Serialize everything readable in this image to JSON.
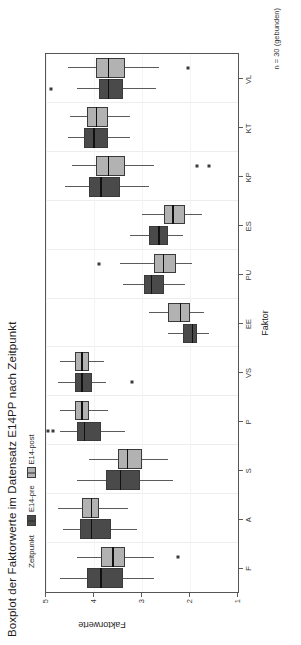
{
  "chart": {
    "title": "Boxplot der Faktorwerte im Datensatz E14PP nach Zeitpunkt",
    "caption": "n = 30 (gebunden)",
    "legend": {
      "title": "Zeitpunkt",
      "items": [
        {
          "label": "E14-pre",
          "color": "#4a4a4a",
          "key": "legend-key-pre"
        },
        {
          "label": "E14-post",
          "color": "#b2b2b2",
          "key": "legend-key-post"
        }
      ]
    },
    "x_axis": {
      "title": "Faktor"
    },
    "y_axis": {
      "title": "Faktorwerte",
      "ticks": [
        "5",
        "4",
        "3",
        "2",
        "1"
      ]
    }
  },
  "chart_data": {
    "type": "boxplot",
    "title": "Boxplot der Faktorwerte im Datensatz E14PP nach Zeitpunkt",
    "subtitle": "",
    "caption": "n = 30 (gebunden)",
    "xlabel": "Faktor",
    "ylabel": "Faktorwerte",
    "ylim": [
      1,
      5
    ],
    "yticks": [
      5,
      4,
      3,
      2,
      1
    ],
    "y_axis_inverted": true,
    "grid": true,
    "legend_position": "top",
    "legend_title": "Zeitpunkt",
    "orientation": "horizontal-boxes",
    "categories": [
      "F",
      "A",
      "S",
      "P",
      "VS",
      "EE",
      "PU",
      "ES",
      "KP",
      "KT",
      "VL"
    ],
    "series": [
      {
        "name": "E14-pre",
        "color": "#4a4a4a",
        "boxes": [
          {
            "category": "F",
            "min": 4.7,
            "q1": 4.15,
            "median": 3.85,
            "q3": 3.4,
            "max": 2.75,
            "outliers": []
          },
          {
            "category": "A",
            "min": 4.65,
            "q1": 4.3,
            "median": 4.05,
            "q3": 3.65,
            "max": 3.1,
            "outliers": []
          },
          {
            "category": "S",
            "min": 4.35,
            "q1": 3.75,
            "median": 3.45,
            "q3": 3.05,
            "max": 2.35,
            "outliers": []
          },
          {
            "category": "P",
            "min": 4.7,
            "q1": 4.35,
            "median": 4.2,
            "q3": 3.85,
            "max": 3.35,
            "outliers": [
              4.95,
              4.85
            ]
          },
          {
            "category": "VS",
            "min": 4.75,
            "q1": 4.4,
            "median": 4.25,
            "q3": 4.05,
            "max": 3.75,
            "outliers": [
              3.2
            ]
          },
          {
            "category": "EE",
            "min": 2.45,
            "q1": 2.15,
            "median": 1.95,
            "q3": 1.85,
            "max": 1.6,
            "outliers": []
          },
          {
            "category": "PU",
            "min": 3.4,
            "q1": 2.95,
            "median": 2.8,
            "q3": 2.55,
            "max": 2.1,
            "outliers": []
          },
          {
            "category": "ES",
            "min": 3.25,
            "q1": 2.85,
            "median": 2.65,
            "q3": 2.45,
            "max": 2.15,
            "outliers": []
          },
          {
            "category": "KP",
            "min": 4.6,
            "q1": 4.1,
            "median": 3.85,
            "q3": 3.45,
            "max": 2.85,
            "outliers": []
          },
          {
            "category": "KT",
            "min": 4.55,
            "q1": 4.2,
            "median": 4.0,
            "q3": 3.7,
            "max": 3.25,
            "outliers": []
          },
          {
            "category": "VL",
            "min": 4.35,
            "q1": 3.9,
            "median": 3.7,
            "q3": 3.4,
            "max": 2.7,
            "outliers": [
              4.9
            ]
          }
        ]
      },
      {
        "name": "E14-post",
        "color": "#b2b2b2",
        "boxes": [
          {
            "category": "F",
            "min": 4.35,
            "q1": 3.85,
            "median": 3.6,
            "q3": 3.35,
            "max": 2.75,
            "outliers": [
              2.25
            ]
          },
          {
            "category": "A",
            "min": 4.75,
            "q1": 4.25,
            "median": 4.05,
            "q3": 3.9,
            "max": 3.3,
            "outliers": []
          },
          {
            "category": "S",
            "min": 4.1,
            "q1": 3.5,
            "median": 3.3,
            "q3": 3.0,
            "max": 2.45,
            "outliers": []
          },
          {
            "category": "P",
            "min": 4.7,
            "q1": 4.4,
            "median": 4.25,
            "q3": 4.1,
            "max": 3.7,
            "outliers": []
          },
          {
            "category": "VS",
            "min": 4.7,
            "q1": 4.4,
            "median": 4.25,
            "q3": 4.1,
            "max": 3.8,
            "outliers": []
          },
          {
            "category": "EE",
            "min": 2.85,
            "q1": 2.45,
            "median": 2.2,
            "q3": 2.0,
            "max": 1.7,
            "outliers": []
          },
          {
            "category": "PU",
            "min": 3.45,
            "q1": 2.75,
            "median": 2.55,
            "q3": 2.3,
            "max": 1.95,
            "outliers": [
              3.9
            ]
          },
          {
            "category": "ES",
            "min": 3.0,
            "q1": 2.55,
            "median": 2.35,
            "q3": 2.1,
            "max": 1.75,
            "outliers": []
          },
          {
            "category": "KP",
            "min": 4.45,
            "q1": 3.95,
            "median": 3.7,
            "q3": 3.35,
            "max": 2.75,
            "outliers": [
              1.85,
              1.6
            ]
          },
          {
            "category": "KT",
            "min": 4.5,
            "q1": 4.15,
            "median": 3.95,
            "q3": 3.7,
            "max": 3.25,
            "outliers": []
          },
          {
            "category": "VL",
            "min": 4.55,
            "q1": 3.95,
            "median": 3.7,
            "q3": 3.35,
            "max": 2.65,
            "outliers": [
              2.05
            ]
          }
        ]
      }
    ]
  }
}
